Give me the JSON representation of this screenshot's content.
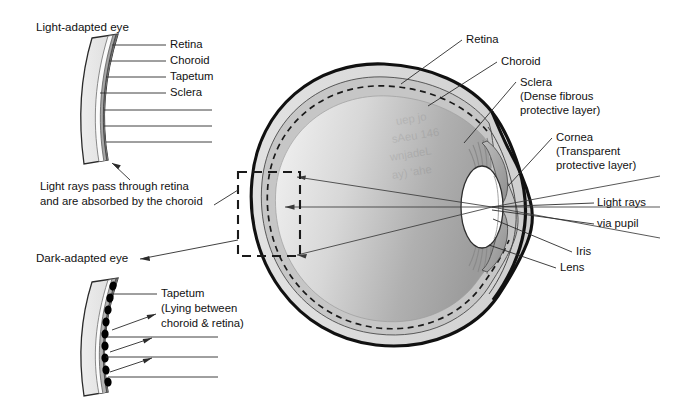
{
  "figure": {
    "background_color": "#ffffff",
    "ink_color": "#111111"
  },
  "palette": {
    "sclera_fill": "#d9d9d9",
    "choroid_fill": "#9a9a9a",
    "tapetum_fill": "#6f6f6f",
    "retina_fill": "#ffffff",
    "vitreous_light": "#f0f0f0",
    "vitreous_dark": "#9d9d9d",
    "lens_fill": "#ffffff",
    "iris_fill": "#a8a8a8",
    "outline": "#111111",
    "tapetum_cell": "#000000"
  },
  "insets": {
    "light_adapted": {
      "heading": "Light-adapted eye",
      "layer_labels": [
        "Retina",
        "Choroid",
        "Tapetum",
        "Sclera"
      ],
      "caption_lines": [
        "Light rays pass through retina",
        "and are absorbed by the choroid"
      ]
    },
    "dark_adapted": {
      "heading": "Dark-adapted eye",
      "label_lines": [
        "Tapetum",
        "(Lying between",
        "choroid & retina)"
      ]
    }
  },
  "main_labels": {
    "retina": {
      "lines": [
        "Retina"
      ]
    },
    "choroid": {
      "lines": [
        "Choroid"
      ]
    },
    "sclera": {
      "lines": [
        "Sclera",
        "(Dense fibrous",
        "protective layer)"
      ]
    },
    "cornea": {
      "lines": [
        "Cornea",
        "(Transparent",
        "protective layer)"
      ]
    },
    "light_rays": {
      "lines": [
        "Light rays",
        "via pupil"
      ]
    },
    "iris": {
      "lines": [
        "Iris"
      ]
    },
    "lens": {
      "lines": [
        "Lens"
      ]
    }
  }
}
